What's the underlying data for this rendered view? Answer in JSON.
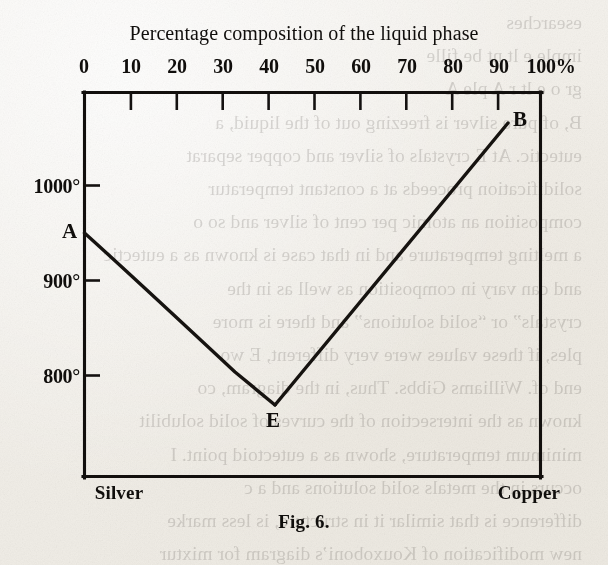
{
  "figure": {
    "title": "Percentage composition of the liquid phase",
    "caption": "Fig. 6."
  },
  "axes": {
    "x_ticks": [
      "0",
      "10",
      "20",
      "30",
      "40",
      "50",
      "60",
      "70",
      "80",
      "90",
      "100%"
    ],
    "y_ticks": [
      "1000°",
      "900°",
      "800°"
    ],
    "left_end_label": "Silver",
    "right_end_label": "Copper"
  },
  "points": [
    {
      "id": "A",
      "label": "A"
    },
    {
      "id": "E",
      "label": "E"
    },
    {
      "id": "B",
      "label": "B"
    }
  ],
  "colors": {
    "ink": "#100e0c",
    "paper": "#f4f2ee",
    "curve": "#161310"
  },
  "ghost_text": [
    "esearches",
    "imple e             lt  nt  be fille",
    "gr         o  e  lt r   A   ple   A",
    "B, of pure silver is freezing out of the liquid, a",
    "eutectic. At E crystals of silver and copper separat",
    "solidification proceeds at a constant temperatur",
    "composition an atomic per cent of silver and so o",
    "a melting temperature and in that case is known as a eutectic",
    "and can vary in composition as well as in the",
    "crystals” or “solid solutions” and there is more",
    "ples, if these values were very different, E wo",
    "end of. Williams Gibbs. Thus, in the diagram, co",
    "known as the intersection of the curves of solid solubilit",
    "minimum temperature, shown as a eutectoid point. I",
    "occurs in the metals solid solutions and a c",
    "difference is that similar it in structure, is less marke",
    "new modification of Kouxoboni’s diagram for mixtur"
  ],
  "chart_data": {
    "type": "line",
    "title": "Percentage composition of the liquid phase",
    "xlabel": "Percentage composition of the liquid phase",
    "ylabel": "Temperature (°C)",
    "xlim": [
      0,
      100
    ],
    "ylim": [
      730,
      1105
    ],
    "grid": false,
    "legend": "none",
    "xticks": [
      0,
      10,
      20,
      30,
      40,
      50,
      60,
      70,
      80,
      90,
      100
    ],
    "xticklabels": [
      "0",
      "10",
      "20",
      "30",
      "40",
      "50",
      "60",
      "70",
      "80",
      "90",
      "100%"
    ],
    "yticks": [
      800,
      900,
      1000
    ],
    "yticklabels": [
      "800°",
      "900°",
      "1000°"
    ],
    "series": [
      {
        "name": "Silver liquidus (A–E)",
        "x": [
          0,
          5,
          10,
          15,
          20,
          25,
          30,
          35,
          40
        ],
        "y": [
          960,
          938,
          915,
          893,
          870,
          845,
          822,
          800,
          779
        ]
      },
      {
        "name": "Copper liquidus (E–B)",
        "x": [
          40,
          50,
          60,
          70,
          80,
          90,
          100
        ],
        "y": [
          779,
          828,
          878,
          928,
          978,
          1028,
          1078
        ]
      }
    ],
    "annotations": [
      {
        "label": "A",
        "x": 0,
        "y": 960,
        "note": "melting point of pure silver"
      },
      {
        "label": "E",
        "x": 40,
        "y": 779,
        "note": "eutectic point"
      },
      {
        "label": "B",
        "x": 100,
        "y": 1078,
        "note": "melting point of pure copper"
      }
    ]
  }
}
